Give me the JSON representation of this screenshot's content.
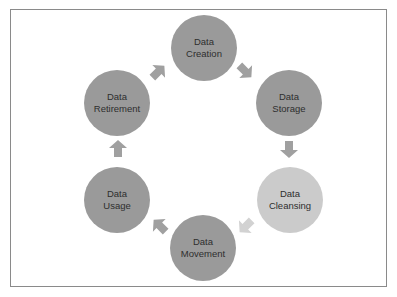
{
  "diagram": {
    "type": "cycle",
    "colors": {
      "node_default": "#9a9a9a",
      "node_highlight": "#cbcbcb",
      "arrow_default": "#a0a0a0",
      "arrow_highlight": "#d2d2d2",
      "text": "#2e2e2e",
      "border": "#8a8a8a"
    },
    "nodes": [
      {
        "id": "creation",
        "line1": "Data",
        "line2": "Creation",
        "cx": 204,
        "cy": 48,
        "highlight": false
      },
      {
        "id": "storage",
        "line1": "Data",
        "line2": "Storage",
        "cx": 289,
        "cy": 103,
        "highlight": false
      },
      {
        "id": "cleansing",
        "line1": "Data",
        "line2": "Cleansing",
        "cx": 290,
        "cy": 200,
        "highlight": true
      },
      {
        "id": "movement",
        "line1": "Data",
        "line2": "Movement",
        "cx": 203,
        "cy": 248,
        "highlight": false
      },
      {
        "id": "usage",
        "line1": "Data",
        "line2": "Usage",
        "cx": 117,
        "cy": 200,
        "highlight": false
      },
      {
        "id": "retirement",
        "line1": "Data",
        "line2": "Retirement",
        "cx": 117,
        "cy": 103,
        "highlight": false
      }
    ],
    "arrows": [
      {
        "from": "creation",
        "to": "storage",
        "x": 245,
        "y": 71,
        "angle": 45,
        "highlight": false
      },
      {
        "from": "storage",
        "to": "cleansing",
        "x": 289,
        "y": 149,
        "angle": 90,
        "highlight": false
      },
      {
        "from": "cleansing",
        "to": "movement",
        "x": 246,
        "y": 226,
        "angle": 135,
        "highlight": true
      },
      {
        "from": "movement",
        "to": "usage",
        "x": 160,
        "y": 226,
        "angle": 225,
        "highlight": false
      },
      {
        "from": "usage",
        "to": "retirement",
        "x": 118,
        "y": 149,
        "angle": 270,
        "highlight": false
      },
      {
        "from": "retirement",
        "to": "creation",
        "x": 158,
        "y": 72,
        "angle": 315,
        "highlight": false
      }
    ]
  }
}
